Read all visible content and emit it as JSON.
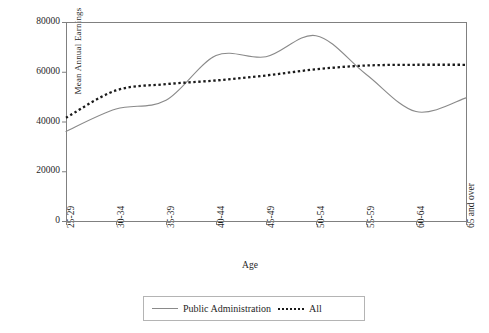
{
  "chart_data": {
    "type": "line",
    "title": "",
    "xlabel": "Age",
    "ylabel": "Mean Annual Earnings",
    "categories": [
      "25-29",
      "30-34",
      "35-39",
      "40-44",
      "45-49",
      "50-54",
      "55-59",
      "60-64",
      "65 and over"
    ],
    "ylim": [
      0,
      80000
    ],
    "yticks": [
      0,
      20000,
      40000,
      60000,
      80000
    ],
    "ytick_labels": [
      "0",
      "20000",
      "40000",
      "60000",
      "80000"
    ],
    "grid": false,
    "legend_position": "bottom",
    "smoothing": "spline",
    "series": [
      {
        "name": "Public Administration",
        "style": "solid",
        "color": "#8a8a8a",
        "values": [
          36000,
          45000,
          48500,
          66500,
          66000,
          74500,
          59000,
          44000,
          49500
        ]
      },
      {
        "name": "All",
        "style": "dotted",
        "color": "#1a1a1a",
        "values": [
          41500,
          52500,
          55000,
          56500,
          58500,
          61000,
          62500,
          62800,
          62800
        ]
      }
    ]
  },
  "axes": {
    "y_title": "Mean Annual Earnings",
    "x_title": "Age"
  },
  "legend": {
    "items": [
      {
        "label": "Public Administration",
        "marker": "solid-line-swatch"
      },
      {
        "label": "All",
        "marker": "dotted-line-swatch"
      }
    ]
  },
  "colors": {
    "public_administration": "#8a8a8a",
    "all": "#1a1a1a",
    "axis": "#808080",
    "text": "#1f1f1f"
  }
}
